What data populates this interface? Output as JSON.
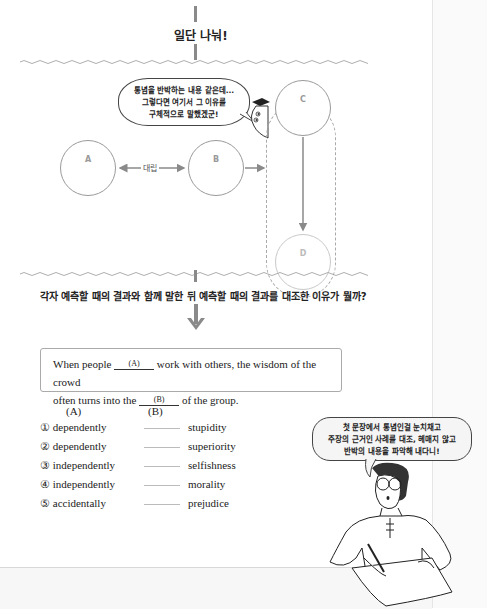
{
  "section_top": {
    "heading": "일단 나눠!"
  },
  "diagram": {
    "speech_bubble_lines": [
      "통념을 반박하는 내용 같은데...",
      "그렇다면 여기서 그 이유를",
      "구체적으로 말했겠군!"
    ],
    "nodes": [
      {
        "id": "A",
        "label": "A"
      },
      {
        "id": "B",
        "label": "B"
      },
      {
        "id": "C",
        "label": "C"
      },
      {
        "id": "D",
        "label": "D"
      }
    ],
    "relation_label": "대립"
  },
  "question": {
    "text": "각자 예측할 때의 결과와 함께 말한 뒤 예측할 때의 결과를 대조한 이유가 뭘까?"
  },
  "summary": {
    "part1": "When people",
    "blank_a": "(A)",
    "part2": "work with others, the wisdom of the crowd",
    "part3": "often turns into the",
    "blank_b": "(B)",
    "part4": "of the group."
  },
  "options": {
    "header_a": "(A)",
    "header_b": "(B)",
    "rows": [
      {
        "num": "①",
        "a": "dependently",
        "b": "stupidity"
      },
      {
        "num": "②",
        "a": "dependently",
        "b": "superiority"
      },
      {
        "num": "③",
        "a": "independently",
        "b": "selfishness"
      },
      {
        "num": "④",
        "a": "independently",
        "b": "morality"
      },
      {
        "num": "⑤",
        "a": "accidentally",
        "b": "prejudice"
      }
    ]
  },
  "tip_bubble": {
    "lines": [
      "첫 문장에서 통념인걸 눈치채고",
      "주장의 근거인 사례를 대조, 헤매지 않고",
      "반박의 내용을 파악해 내다니!"
    ]
  },
  "colors": {
    "accent_gray": "#8a8a8a",
    "line_gray": "#9a9a9a",
    "text": "#222222"
  }
}
